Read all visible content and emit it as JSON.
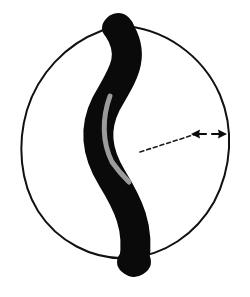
{
  "figure": {
    "background_color": "#ffffff",
    "width": 250,
    "height": 297,
    "alt_text": "A hand-drawn circle outline containing a thick black S-shaped curved band running from top to bottom, with a gray inner highlight line, and a dashed leader line terminating in a double-headed arrow near the right edge"
  },
  "shapes": {
    "sphere_outline": {
      "name": "sphere-outline",
      "kind": "circle",
      "center_x": 126,
      "center_y": 142,
      "radius_x": 105,
      "radius_y": 116,
      "stroke_color": "#111111",
      "stroke_width": 2.0,
      "fill": "none",
      "hand_drawn": true
    },
    "band": {
      "name": "s-curve-band",
      "kind": "path",
      "fill_color": "#0a0a0a",
      "stroke_color": "#0a0a0a",
      "stroke_width": 30,
      "cap": "round",
      "path": "M 118 28 C 138 58, 120 78, 106 104 C 94 128, 96 152, 112 178 C 128 204, 140 228, 134 262",
      "top_end_x": 118,
      "top_end_y": 28,
      "bottom_end_x": 134,
      "bottom_end_y": 262
    },
    "inner_highlight": {
      "name": "band-inner-highlight",
      "kind": "path",
      "stroke_color": "#9b9b9b",
      "stroke_width": 5,
      "cap": "round",
      "path": "M 110 96 C 102 118, 102 142, 112 162 C 120 172, 126 178, 130 182",
      "start_x": 110,
      "start_y": 96,
      "end_x": 130,
      "end_y": 182
    },
    "leader_line": {
      "name": "dashed-leader-line",
      "kind": "line",
      "x1": 140,
      "y1": 152,
      "x2": 196,
      "y2": 134,
      "stroke_color": "#1a1a1a",
      "stroke_width": 1.6,
      "dash_pattern": "4 3"
    },
    "arrow_left": {
      "name": "arrow-left-head",
      "direction": "left",
      "tip_x": 192,
      "tip_y": 134,
      "tail_x": 206,
      "tail_y": 134,
      "color": "#0a0a0a"
    },
    "arrow_right": {
      "name": "arrow-right-head",
      "direction": "right",
      "tip_x": 226,
      "tip_y": 134,
      "tail_x": 212,
      "tail_y": 134,
      "color": "#0a0a0a"
    }
  },
  "labels": {
    "measurement_label": "",
    "axis_label": "",
    "annotation": ""
  }
}
